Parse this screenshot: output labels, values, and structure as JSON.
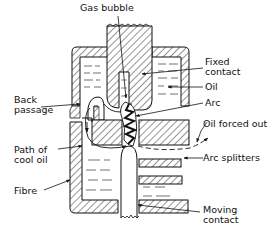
{
  "diagram": {
    "type": "cross-section",
    "colors": {
      "line": "#111111",
      "background": "#ffffff"
    }
  },
  "labels": {
    "gas_bubble": "Gas bubble",
    "fixed_contact_1": "Fixed",
    "fixed_contact_2": "contact",
    "oil": "Oil",
    "arc": "Arc",
    "back_passage_1": "Back",
    "back_passage_2": "passage",
    "oil_forced_out": "Oil forced out",
    "path_of_cool_oil_1": "Path of",
    "path_of_cool_oil_2": "cool oil",
    "arc_splitters": "Arc splitters",
    "fibre": "Fibre",
    "moving_contact_1": "Moving",
    "moving_contact_2": "contact"
  }
}
